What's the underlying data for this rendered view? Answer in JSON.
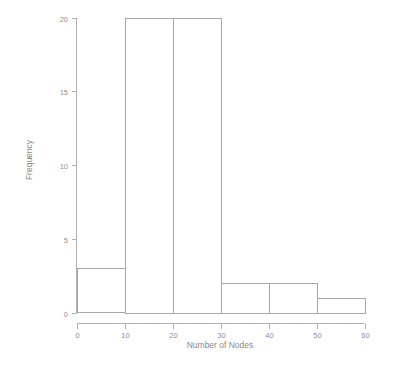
{
  "chart_data": {
    "type": "bar",
    "title": "",
    "subtitle": "",
    "xlabel": "Number of Nodes",
    "ylabel": "Frequency",
    "xlim": [
      0,
      60
    ],
    "ylim": [
      0,
      20
    ],
    "grid": false,
    "legend": null,
    "bin_width": 10,
    "bin_edges": [
      0,
      10,
      20,
      30,
      40,
      50,
      60
    ],
    "categories": [
      "0-10",
      "10-20",
      "20-30",
      "30-40",
      "40-50",
      "50-60"
    ],
    "values": [
      3,
      20,
      20,
      2,
      2,
      1
    ],
    "x_ticks": [
      0,
      10,
      20,
      30,
      40,
      50,
      60
    ],
    "x_tick_labels": [
      "0",
      "10",
      "20",
      "30",
      "40",
      "50",
      "60"
    ],
    "y_ticks": [
      0,
      5,
      10,
      15,
      20
    ],
    "y_tick_labels": [
      "0",
      "5",
      "10",
      "15",
      "20"
    ],
    "bar_fill": "none",
    "bar_stroke": "#a8a8a8",
    "axis_color": "#b0b0b0",
    "background": "#ffffff",
    "total_count": 48
  },
  "axes": {
    "x_title": "Number of Nodes",
    "y_title": "Frequency"
  }
}
